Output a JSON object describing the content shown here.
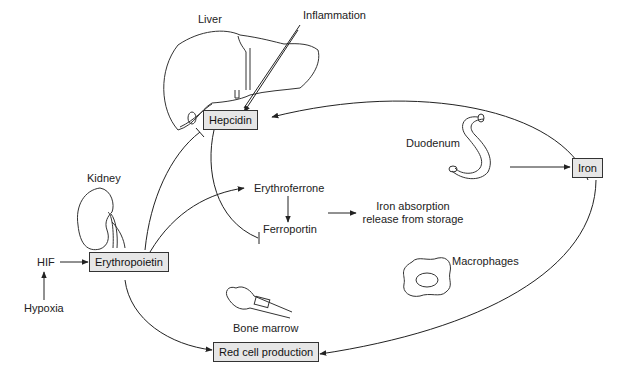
{
  "organs": {
    "liver": "Liver",
    "kidney": "Kidney",
    "duodenum": "Duodenum",
    "macrophages": "Macrophages",
    "bone_marrow": "Bone marrow"
  },
  "nodes": {
    "hepcidin": "Hepcidin",
    "erythropoietin": "Erythropoietin",
    "iron": "Iron",
    "red_cell_production": "Red cell production"
  },
  "labels": {
    "inflammation": "Inflammation",
    "erythroferrone": "Erythroferrone",
    "ferroportin": "Ferroportin",
    "iron_absorption_line1": "Iron absorption",
    "iron_absorption_line2": "release from storage",
    "hif": "HIF",
    "hypoxia": "Hypoxia"
  },
  "colors": {
    "line": "#222222",
    "box_fill": "#e6e6e6",
    "box_border": "#333333"
  }
}
